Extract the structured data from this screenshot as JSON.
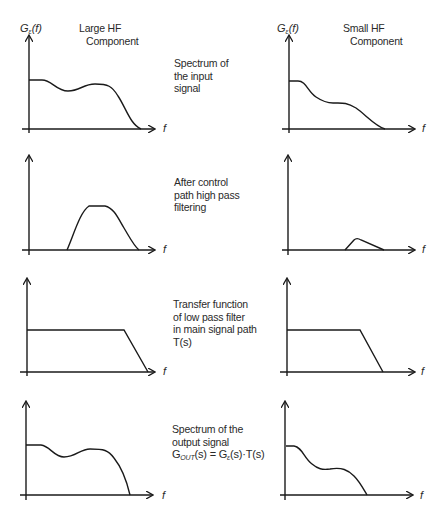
{
  "columns": {
    "left": {
      "title_line1": "Large HF",
      "title_line2": "Component",
      "y_label_main": "G",
      "y_label_sub": "ε",
      "y_label_arg": "(f)"
    },
    "right": {
      "title_line1": "Small HF",
      "title_line2": "Component",
      "y_label_main": "G",
      "y_label_sub": "ε",
      "y_label_arg": "(f)"
    }
  },
  "axis": {
    "x_label": "f"
  },
  "rows": [
    {
      "description": [
        "Spectrum of",
        "the input",
        "signal"
      ]
    },
    {
      "description": [
        "After control",
        "path high pass",
        "filtering"
      ]
    },
    {
      "description": [
        "Transfer function",
        "of low pass filter",
        "in main signal path"
      ],
      "formula": "T(s)"
    },
    {
      "description": [
        "Spectrum of the",
        "output signal"
      ],
      "formula_parts": {
        "g_out": "G",
        "out_sub": "OUT",
        "lhs_arg": "(s) = G",
        "eps_sub": "ε",
        "rhs": "(s)·T(s)"
      }
    }
  ],
  "colors": {
    "line": "#1a1a1a",
    "text": "#2a2a2a",
    "background": "#ffffff"
  }
}
